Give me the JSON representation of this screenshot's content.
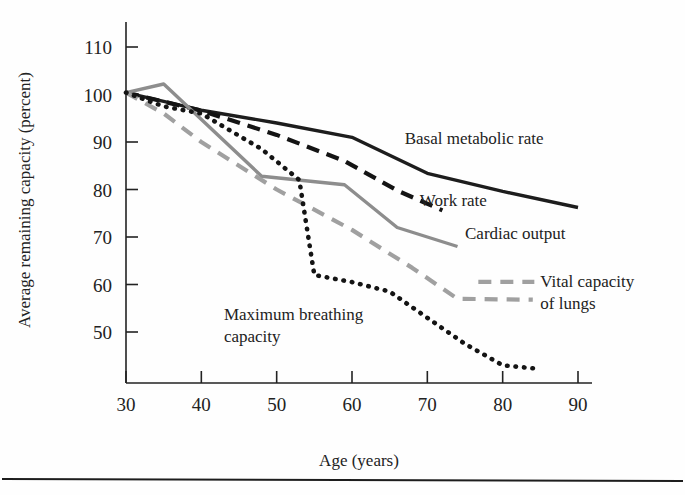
{
  "figure": {
    "background": "#fefefe",
    "footer_rule": true
  },
  "chart_data": {
    "type": "line",
    "title": "",
    "xlabel": "Age (years)",
    "ylabel": "Average remaining capacity (percent)",
    "xlim": [
      30,
      92
    ],
    "ylim": [
      40,
      113
    ],
    "xticks": [
      30,
      40,
      50,
      60,
      70,
      80,
      90
    ],
    "xticklabels": [
      "30",
      "40",
      "50",
      "60",
      "70",
      "80",
      "90"
    ],
    "yticks": [
      50,
      60,
      70,
      80,
      90,
      100,
      110
    ],
    "yticklabels": [
      "50",
      "60",
      "70",
      "80",
      "90",
      "100",
      "110"
    ],
    "grid": false,
    "legend_position": "inline-right-of-curve-ends",
    "series": [
      {
        "name": "Basal metabolic rate",
        "label": "Basal metabolic rate",
        "color": "#1d1d1d",
        "style": "solid",
        "width": 3.4,
        "x": [
          30,
          40,
          50,
          60,
          70,
          80,
          90
        ],
        "y": [
          100.4,
          96.7,
          94.0,
          91.0,
          83.4,
          79.6,
          76.2
        ],
        "label_x": 67,
        "label_y": 89.5
      },
      {
        "name": "Work rate",
        "label": "Work rate",
        "color": "#141414",
        "style": "dashed",
        "width": 4.2,
        "dash": "13,8",
        "x": [
          30,
          35,
          40,
          50,
          59,
          66,
          72
        ],
        "y": [
          100.4,
          98.5,
          96.6,
          91.5,
          86.0,
          79.8,
          75.6
        ],
        "label_x": 69,
        "label_y": 76.5
      },
      {
        "name": "Cardiac output",
        "label": "Cardiac output",
        "color": "#8d8d8d",
        "style": "solid",
        "width": 3.4,
        "x": [
          30,
          35,
          48,
          59,
          66,
          74
        ],
        "y": [
          100.4,
          102.2,
          82.8,
          81.0,
          72.0,
          68.0
        ],
        "label_x": 75,
        "label_y": 69.5
      },
      {
        "name": "Vital capacity of lungs",
        "label": "Vital capacity\nof lungs",
        "label_line1": "Vital capacity",
        "label_line2": "of lungs",
        "color": "#a0a0a0",
        "style": "dashed",
        "width": 4.2,
        "dash": "13,9",
        "x": [
          30,
          35,
          40,
          50,
          60,
          68,
          74,
          84
        ],
        "y": [
          100.4,
          96.0,
          90.0,
          80.0,
          71.5,
          63.5,
          57.0,
          56.8
        ],
        "label_x": 85,
        "label_y": 59.5
      },
      {
        "name": "Maximum breathing capacity",
        "label": "Maximum breathing\ncapacity",
        "label_line1": "Maximum breathing",
        "label_line2": "capacity",
        "color": "#141414",
        "style": "dotted",
        "width": 4.6,
        "dash": "0.5,8",
        "x": [
          30,
          35,
          40,
          48,
          53,
          55,
          60,
          65,
          70,
          75,
          80,
          85
        ],
        "y": [
          100.4,
          97.5,
          96.0,
          88.5,
          82.0,
          62.0,
          60.5,
          58.5,
          53.0,
          47.5,
          43.0,
          42.2
        ],
        "label_x": 43,
        "label_y": 52.5
      }
    ]
  }
}
